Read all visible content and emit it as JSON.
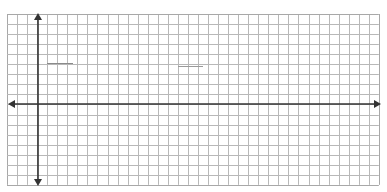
{
  "figure": {
    "type": "coordinate-plane-grid",
    "background": "#ffffff",
    "grid": {
      "left": 7,
      "top": 14,
      "cell": 10.05,
      "cols": 37,
      "rows": 17,
      "line_color": "#b8b8b8",
      "border_color": "#a8a8a8"
    },
    "axes": {
      "color": "#333333",
      "x_axis_y": 104,
      "y_axis_x": 38,
      "x_axis_from": 8,
      "x_axis_to": 381,
      "y_axis_from": 13,
      "y_axis_to": 186,
      "arrows": [
        "left",
        "right",
        "up",
        "down"
      ]
    },
    "marks": [
      {
        "x1": 47,
        "x2": 73,
        "y": 63,
        "color": "#8a8a8a"
      },
      {
        "x1": 178,
        "x2": 203,
        "y": 66,
        "color": "#9a9a9a"
      }
    ]
  }
}
